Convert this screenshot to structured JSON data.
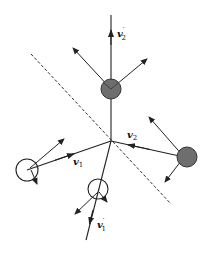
{
  "diagram": {
    "type": "vector-collision-diagram",
    "labels": {
      "v1": "v",
      "v1_sub": "1",
      "v2": "v",
      "v2_sub": "2",
      "v1_prime": "v",
      "v1_prime_sub": "1",
      "v1_prime_mark": "′",
      "v2_prime": "v",
      "v2_prime_sub": "2",
      "v2_prime_mark": "′"
    },
    "colors": {
      "line": "#222222",
      "filled_circle": "#6e6e6e",
      "hollow_circle": "#ffffff",
      "dashed_line": "#333333"
    },
    "nodes": [
      {
        "id": "top-filled",
        "fill": "filled"
      },
      {
        "id": "right-filled",
        "fill": "filled"
      },
      {
        "id": "left-hollow",
        "fill": "hollow"
      },
      {
        "id": "bottom-hollow",
        "fill": "hollow"
      }
    ]
  }
}
